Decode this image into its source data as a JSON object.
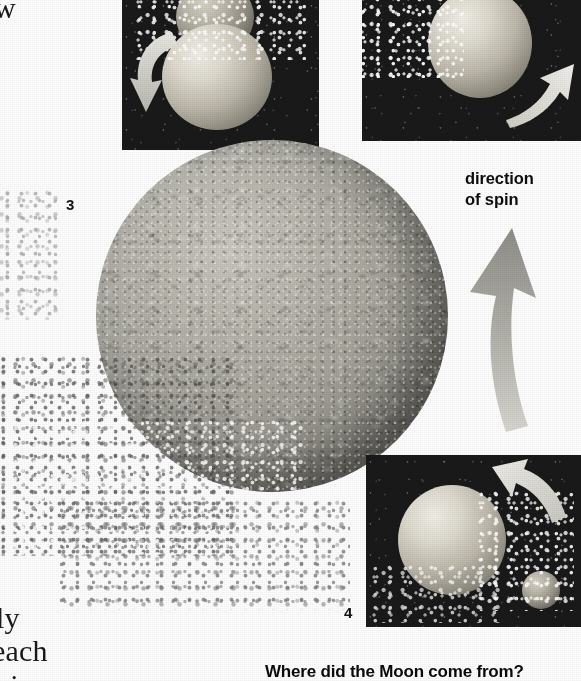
{
  "page": {
    "width": 581,
    "height": 681,
    "background_color": "#ffffff",
    "medium": "scanned print illustration"
  },
  "figure": {
    "caption": "Where did the Moon come from?",
    "spin_label_line1": "direction",
    "spin_label_line2": "of spin",
    "panel_numbers": [
      "1",
      "2",
      "3",
      "4"
    ]
  },
  "body_text_fragments": [
    {
      "text": "w",
      "note": "clipped left column line"
    },
    {
      "text": "ly",
      "note": "clipped left column line"
    },
    {
      "text": "each",
      "note": "clipped left column line"
    },
    {
      "text": "t i",
      "note": "clipped left column line"
    }
  ],
  "panels": [
    {
      "number": "1",
      "name": "impact-panel",
      "description": "Impactor striking the proto-Earth, ejecta spraying upward",
      "arrow": "curved-arrow-down-left",
      "background_color": "#191919"
    },
    {
      "number": "2",
      "name": "ejecta-panel",
      "description": "Molten proto-Earth with debris streaming off to the left",
      "arrow": "curved-arrow-up-right",
      "background_color": "#191919"
    },
    {
      "number": "3",
      "name": "main-planet",
      "description": "Large mottled proto-Earth with debris ring trailing lower left",
      "arrow": "none",
      "background_color": "#ffffff"
    },
    {
      "number": "4",
      "name": "moon-forming-panel",
      "description": "Proto-Earth with coalescing Moon forming at lower right",
      "arrow": "curved-arrow-up-left",
      "background_color": "#191919"
    }
  ],
  "colors": {
    "page_background": "#ffffff",
    "panel_background": "#191919",
    "planet_midtone": "#a9a79e",
    "planet_shadow": "#4a4845",
    "arrow_gray": "#9a9a95",
    "text_black": "#0d0d0d"
  }
}
